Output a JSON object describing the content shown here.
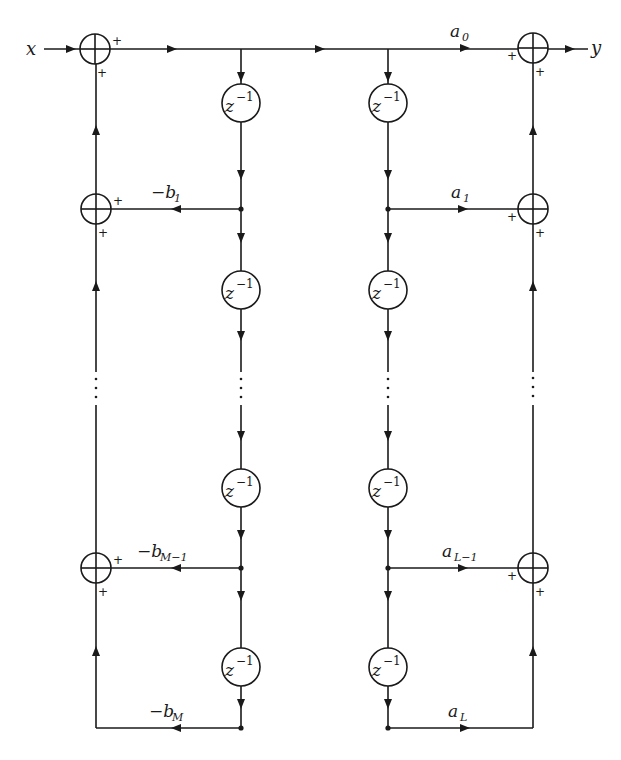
{
  "diagram": {
    "type": "signal-flow block diagram (Direct Form I IIR filter)",
    "input_label": "x",
    "output_label": "y",
    "delay_label": "z",
    "delay_exponent": "−1",
    "adder_sign": "+",
    "ellipsis": "⋮",
    "feedback_gains": [
      {
        "base": "−b",
        "sub": "1"
      },
      {
        "base": "−b",
        "sub": "M−1"
      },
      {
        "base": "−b",
        "sub": "M"
      }
    ],
    "feedforward_gains": [
      {
        "base": "a",
        "sub": "0"
      },
      {
        "base": "a",
        "sub": "1"
      },
      {
        "base": "a",
        "sub": "L−1"
      },
      {
        "base": "a",
        "sub": "L"
      }
    ],
    "colors": {
      "ink": "#1a1a1a",
      "background": "#ffffff"
    }
  }
}
